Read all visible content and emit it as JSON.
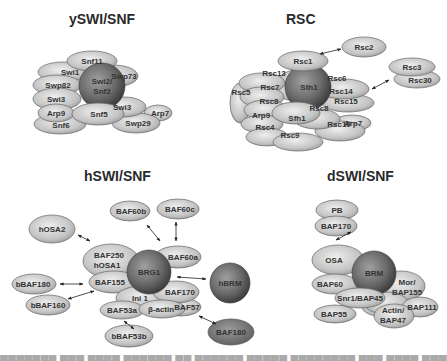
{
  "panels": [
    {
      "title": "ySWI/SNF",
      "hub": "Swi2/\nSnf2",
      "subunits": [
        "Snf11",
        "Swi1",
        "Swp82",
        "Swi3",
        "Swp73",
        "Arp9",
        "Snf6",
        "Snf5",
        "Swi3",
        "Arp7",
        "Swp29"
      ]
    },
    {
      "title": "RSC",
      "hub": "Sth1",
      "subunits": [
        "Rsc1",
        "Rsc2",
        "Rsc13",
        "Rsc7",
        "Rsc5",
        "Rsc8",
        "Arp9",
        "Rsc4",
        "Rsc9",
        "Sfh1",
        "Rsc8",
        "Rsc6",
        "Rsc14",
        "Rsc15",
        "Arp7",
        "Rsc10",
        "Rsc3",
        "Rsc30"
      ]
    },
    {
      "title": "hSWI/SNF",
      "hub": "BRG1",
      "alt_hub": "hBRM",
      "subunits": [
        "hOSA2",
        "BAF60b",
        "BAF60c",
        "BAF250\nhOSA1",
        "BAF60a",
        "BAF155",
        "bBAF180",
        "bBAF160",
        "Ini 1",
        "BAF170",
        "BAF53a",
        "β-actin",
        "BAF57",
        "bBAF53b",
        "BAF180"
      ]
    },
    {
      "title": "dSWI/SNF",
      "hub": "BRM",
      "subunits": [
        "PB",
        "BAP170",
        "OSA",
        "BAP60",
        "Mor/\nBAP155",
        "Snr1/BAP45",
        "BAP55",
        "Actin/\nBAP47",
        "BAP111"
      ]
    }
  ],
  "labels": {
    "yswi": "ySWI/SNF",
    "rsc": "RSC",
    "hswi": "hSWI/SNF",
    "dswi": "dSWI/SNF"
  },
  "colors": {
    "subunit_light": "#e6e6e6",
    "subunit_mid": "#a9a9a9",
    "hub_light": "#9a9a9a",
    "hub_dark": "#3e3e3e",
    "outline": "#5a5a5a"
  }
}
